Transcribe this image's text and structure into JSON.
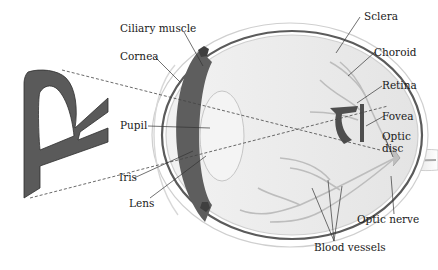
{
  "figure": {
    "stimulus_letter": "R",
    "retinal_image_letter": "R (inverted)"
  },
  "labels": {
    "ciliary_muscle": "Ciliary muscle",
    "cornea": "Cornea",
    "pupil": "Pupil",
    "iris": "Iris",
    "lens": "Lens",
    "sclera": "Sclera",
    "choroid": "Choroid",
    "retina": "Retina",
    "fovea": "Fovea",
    "optic_disc_line1": "Optic",
    "optic_disc_line2": "disc",
    "optic_nerve": "Optic nerve",
    "blood_vessels": "Blood vessels"
  },
  "colors": {
    "background": "#ffffff",
    "letter_fill": "#5a5a5a",
    "sclera": "#e6e6e6",
    "choroid": "#555555",
    "vitreous": "#eeeeee",
    "vessels": "#b8b8b8",
    "leader_lines": "#333333"
  }
}
